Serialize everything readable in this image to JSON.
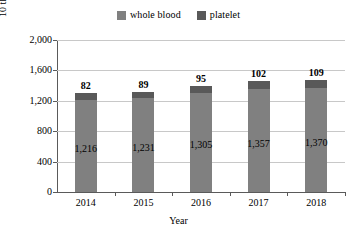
{
  "chart_data": {
    "type": "bar",
    "subtype": "stacked-bar",
    "title": "",
    "xlabel": "Year",
    "ylabel": "10 thousand people",
    "categories": [
      "2014",
      "2015",
      "2016",
      "2017",
      "2018"
    ],
    "series": [
      {
        "name": "whole blood",
        "color": "#808080",
        "values": [
          1216,
          1231,
          1305,
          1357,
          1370
        ],
        "value_labels": [
          "1,216",
          "1,231",
          "1,305",
          "1,357",
          "1,370"
        ]
      },
      {
        "name": "platelet",
        "color": "#595959",
        "values": [
          82,
          89,
          95,
          102,
          109
        ],
        "value_labels": [
          "82",
          "89",
          "95",
          "102",
          "109"
        ]
      }
    ],
    "totals": [
      1298,
      1320,
      1400,
      1459,
      1479
    ],
    "ylim": [
      0,
      2000
    ],
    "yticks": [
      0,
      400,
      800,
      1200,
      1600,
      2000
    ],
    "ytick_labels": [
      "0",
      "400",
      "800",
      "1,200",
      "1,600",
      "2,000"
    ],
    "grid": true,
    "grid_axis": "y",
    "legend_position": "top-center"
  },
  "legend": {
    "entries": [
      {
        "label": "whole blood",
        "color": "#808080"
      },
      {
        "label": "platelet",
        "color": "#595959"
      }
    ]
  },
  "axes": {
    "y_title": "10 thousand people",
    "x_title": "Year"
  }
}
